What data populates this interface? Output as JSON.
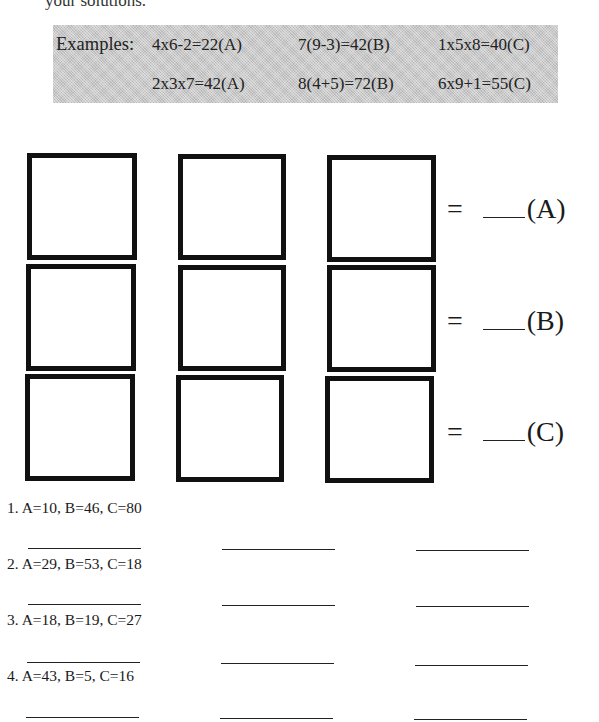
{
  "header": {
    "partial_text": "your solutions."
  },
  "examples": {
    "label": "Examples:",
    "row1": [
      "4x6-2=22(A)",
      "7(9-3)=42(B)",
      "1x5x8=40(C)"
    ],
    "row2": [
      "2x3x7=42(A)",
      "8(4+5)=72(B)",
      "6x9+1=55(C)"
    ]
  },
  "grid": {
    "rows": [
      {
        "equals": "=",
        "label": "(A)"
      },
      {
        "equals": "=",
        "label": "(B)"
      },
      {
        "equals": "=",
        "label": "(C)"
      }
    ]
  },
  "problems": [
    {
      "number": "1.",
      "text": "A=10, B=46, C=80"
    },
    {
      "number": "2.",
      "text": "A=29, B=53, C=18"
    },
    {
      "number": "3.",
      "text": "A=18, B=19, C=27"
    },
    {
      "number": "4.",
      "text": "A=43, B=5, C=16"
    }
  ]
}
